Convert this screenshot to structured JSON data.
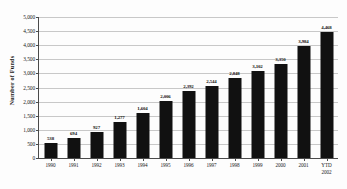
{
  "chart_data": {
    "type": "bar",
    "title": "",
    "xlabel": "",
    "ylabel": "Number of Funds",
    "ylim": [
      0,
      5000
    ],
    "ytick_step": 500,
    "grid": true,
    "legend": false,
    "bar_color": "#111111",
    "gridline_color": "#c8c8c8",
    "axis_color": "#4a4a4a",
    "categories": [
      "1990",
      "1991",
      "1992",
      "1993",
      "1994",
      "1995",
      "1996",
      "1997",
      "1998",
      "1999",
      "2000",
      "2001",
      "YTD\n2002"
    ],
    "category_labels": [
      {
        "line1": "1990",
        "line2": ""
      },
      {
        "line1": "1991",
        "line2": ""
      },
      {
        "line1": "1992",
        "line2": ""
      },
      {
        "line1": "1993",
        "line2": ""
      },
      {
        "line1": "1994",
        "line2": ""
      },
      {
        "line1": "1995",
        "line2": ""
      },
      {
        "line1": "1996",
        "line2": ""
      },
      {
        "line1": "1997",
        "line2": ""
      },
      {
        "line1": "1998",
        "line2": ""
      },
      {
        "line1": "1999",
        "line2": ""
      },
      {
        "line1": "2000",
        "line2": ""
      },
      {
        "line1": "2001",
        "line2": ""
      },
      {
        "line1": "YTD",
        "line2": "2002"
      }
    ],
    "values": [
      538,
      694,
      927,
      1277,
      1604,
      2006,
      2392,
      2544,
      2848,
      3102,
      3350,
      3984,
      4468
    ],
    "value_labels": [
      "538",
      "694",
      "927",
      "1,277",
      "1,604",
      "2,006",
      "2,392",
      "2,544",
      "2,848",
      "3,102",
      "3,350",
      "3,984",
      "4,468"
    ],
    "ytick_labels": [
      "0",
      "500",
      "1,000",
      "1,500",
      "2,000",
      "2,500",
      "3,000",
      "3,500",
      "4,000",
      "4,500",
      "5,000"
    ],
    "ytick_values": [
      0,
      500,
      1000,
      1500,
      2000,
      2500,
      3000,
      3500,
      4000,
      4500,
      5000
    ]
  }
}
